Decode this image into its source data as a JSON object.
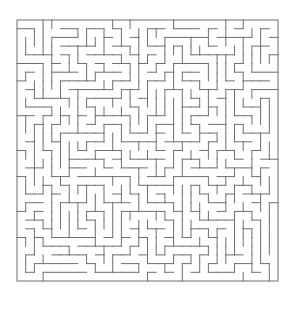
{
  "figure": {
    "kind": "maze-puzzle",
    "title": "",
    "caption": "",
    "background_color": "#ffffff",
    "wall_color": "#6f6f6f",
    "path_color": "#ffffff",
    "border_color": "#6f6f6f"
  },
  "maze": {
    "columns": 30,
    "rows": 30,
    "cell_size": 8.7,
    "wall_thickness": 1,
    "origin_x": 17,
    "origin_y": 20,
    "width_px": 261,
    "height_px": 261,
    "entrance": {
      "side": "none",
      "index": -1
    },
    "exit": {
      "side": "none",
      "index": -1
    },
    "perfect": true,
    "seed": 20259143,
    "style": "orthogonal-grid"
  },
  "legend": {
    "items": []
  }
}
